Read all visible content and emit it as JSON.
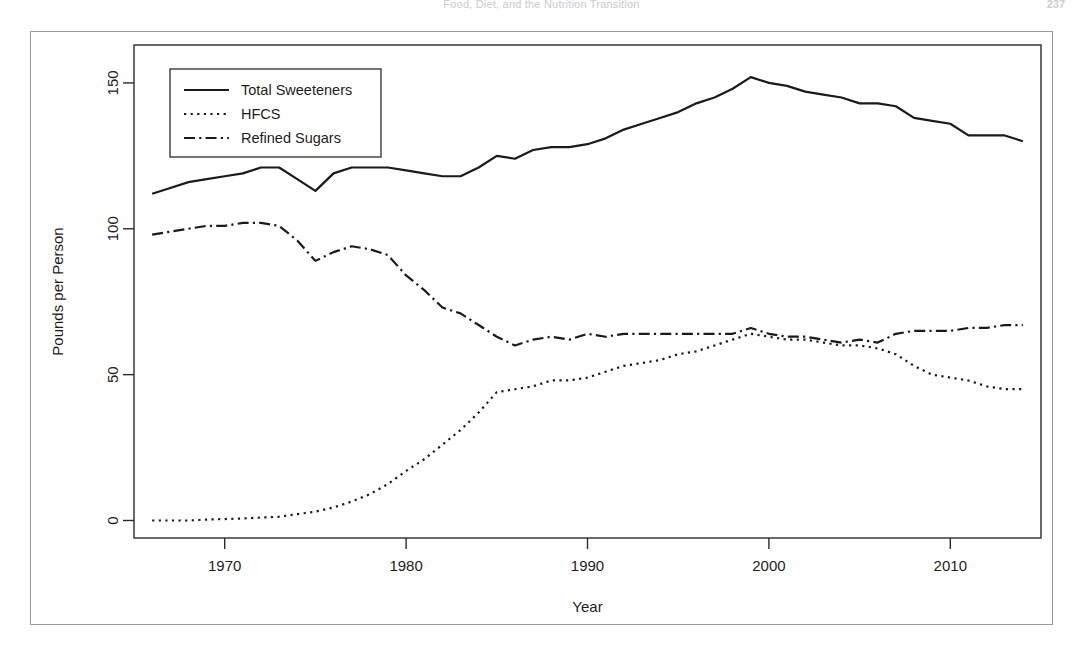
{
  "page": {
    "running_head": "Food, Diet, and the Nutrition Transition",
    "page_number": "237"
  },
  "chart_data": {
    "type": "line",
    "title": "",
    "xlabel": "Year",
    "ylabel": "Pounds per Person",
    "xlim": [
      1965,
      2015
    ],
    "ylim": [
      -6,
      163
    ],
    "xticks": [
      1970,
      1980,
      1990,
      2000,
      2010
    ],
    "xtick_labels": [
      "1970",
      "1980",
      "1990",
      "2000",
      "2010"
    ],
    "yticks": [
      0,
      50,
      100,
      150
    ],
    "ytick_labels": [
      "0",
      "50",
      "100",
      "150"
    ],
    "grid": false,
    "legend_position": "top-left",
    "legend": [
      "Total Sweeteners",
      "HFCS",
      "Refined Sugars"
    ],
    "line_color": "#1a1a1a",
    "x": [
      1966,
      1967,
      1968,
      1969,
      1970,
      1971,
      1972,
      1973,
      1974,
      1975,
      1976,
      1977,
      1978,
      1979,
      1980,
      1981,
      1982,
      1983,
      1984,
      1985,
      1986,
      1987,
      1988,
      1989,
      1990,
      1991,
      1992,
      1993,
      1994,
      1995,
      1996,
      1997,
      1998,
      1999,
      2000,
      2001,
      2002,
      2003,
      2004,
      2005,
      2006,
      2007,
      2008,
      2009,
      2010,
      2011,
      2012,
      2013,
      2014
    ],
    "series": [
      {
        "name": "Total Sweeteners",
        "dash": "solid",
        "width": 2.2,
        "values": [
          112,
          114,
          116,
          117,
          118,
          119,
          121,
          121,
          117,
          113,
          119,
          121,
          121,
          121,
          120,
          119,
          118,
          118,
          121,
          125,
          124,
          127,
          128,
          128,
          129,
          131,
          134,
          136,
          138,
          140,
          143,
          145,
          148,
          152,
          150,
          149,
          147,
          146,
          145,
          143,
          143,
          142,
          138,
          137,
          136,
          132,
          132,
          132,
          130
        ]
      },
      {
        "name": "HFCS",
        "dash": "dotted",
        "width": 2.2,
        "values": [
          0,
          0,
          0,
          0.3,
          0.5,
          0.7,
          1.0,
          1.3,
          2.2,
          3.0,
          4.5,
          6.5,
          9.0,
          12.5,
          17,
          21,
          26,
          31,
          37,
          44,
          45,
          46,
          48,
          48,
          49,
          51,
          53,
          54,
          55,
          57,
          58,
          60,
          62,
          64,
          63,
          62,
          62,
          61,
          60,
          60,
          59,
          57,
          53,
          50,
          49,
          48,
          46,
          45,
          45
        ]
      },
      {
        "name": "Refined Sugars",
        "dash": "dashdot",
        "width": 2.2,
        "values": [
          98,
          99,
          100,
          101,
          101,
          102,
          102,
          101,
          96,
          89,
          92,
          94,
          93,
          91,
          84,
          79,
          73,
          71,
          67,
          63,
          60,
          62,
          63,
          62,
          64,
          63,
          64,
          64,
          64,
          64,
          64,
          64,
          64,
          66,
          64,
          63,
          63,
          62,
          61,
          62,
          61,
          64,
          65,
          65,
          65,
          66,
          66,
          67,
          67
        ]
      }
    ]
  }
}
